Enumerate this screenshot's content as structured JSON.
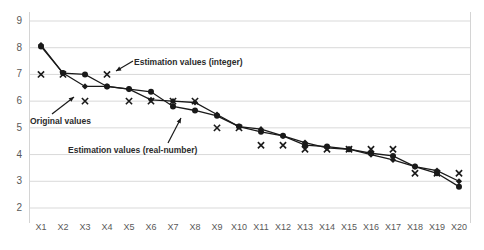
{
  "chart_data": {
    "type": "line",
    "title": "",
    "xlabel": "",
    "ylabel": "",
    "ylim": [
      2,
      9
    ],
    "yticks": [
      2,
      3,
      4,
      5,
      6,
      7,
      8,
      9
    ],
    "grid": true,
    "legend": "none",
    "categories": [
      "X1",
      "X2",
      "X3",
      "X4",
      "X5",
      "X6",
      "X7",
      "X8",
      "X9",
      "X10",
      "X11",
      "X12",
      "X13",
      "X14",
      "X15",
      "X16",
      "X17",
      "X18",
      "X19",
      "X20"
    ],
    "series": [
      {
        "name": "Original values",
        "marker": "circle",
        "color": "#1a1a1a",
        "values": [
          8.05,
          7.05,
          7.0,
          6.55,
          6.45,
          6.35,
          5.8,
          5.65,
          5.45,
          5.05,
          4.85,
          4.7,
          4.35,
          4.3,
          4.2,
          4.05,
          3.95,
          3.55,
          3.3,
          2.8
        ]
      },
      {
        "name": "Estimation values (real-number)",
        "marker": "diamond",
        "color": "#1a1a1a",
        "values": [
          8.1,
          7.05,
          6.55,
          6.55,
          6.45,
          6.05,
          6.0,
          5.95,
          5.5,
          5.05,
          4.95,
          4.7,
          4.45,
          4.25,
          4.2,
          4.0,
          3.8,
          3.55,
          3.4,
          3.0
        ]
      },
      {
        "name": "Estimation values (integer)",
        "marker": "x",
        "color": "#1a1a1a",
        "values": [
          7.0,
          7.0,
          6.0,
          7.0,
          6.0,
          6.0,
          6.0,
          6.0,
          5.0,
          5.0,
          4.35,
          4.35,
          4.2,
          4.2,
          4.2,
          4.2,
          4.2,
          3.3,
          3.3,
          3.3
        ],
        "line": false
      }
    ],
    "annotations": [
      {
        "name": "estimation-integer-label",
        "text": "Estimation values (integer)"
      },
      {
        "name": "original-values-label",
        "text": "Original values"
      },
      {
        "name": "estimation-real-label",
        "text": "Estimation values (real-number)"
      }
    ]
  }
}
